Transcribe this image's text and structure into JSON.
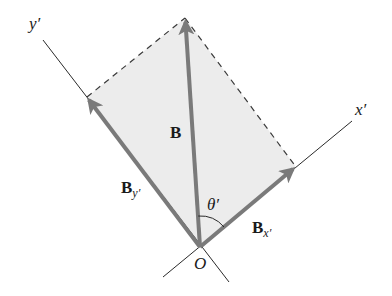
{
  "diagram": {
    "colors": {
      "background": "#ffffff",
      "parallelogram_fill": "#ececec",
      "vector": "#7a7a7a",
      "axis": "#2a2a2a",
      "dashed": "#3a3a3a",
      "text": "#1a1a1a"
    },
    "points": {
      "origin": [
        200,
        247
      ],
      "B_tip": [
        185,
        18
      ],
      "By_tip": [
        87,
        97
      ],
      "Bx_tip": [
        296,
        167
      ]
    },
    "axes": {
      "x_prime": {
        "label": "x′",
        "from": [
          163,
          277
        ],
        "to": [
          352,
          121
        ]
      },
      "y_prime": {
        "label": "y′",
        "from": [
          229,
          282
        ],
        "to": [
          43,
          40
        ]
      }
    },
    "vectors": [
      {
        "name": "B",
        "label": "B",
        "subscript": ""
      },
      {
        "name": "B_y'",
        "label": "B",
        "subscript": "y′"
      },
      {
        "name": "B_x'",
        "label": "B",
        "subscript": "x′"
      }
    ],
    "angle": {
      "label": "θ′"
    },
    "origin_label": "O"
  }
}
